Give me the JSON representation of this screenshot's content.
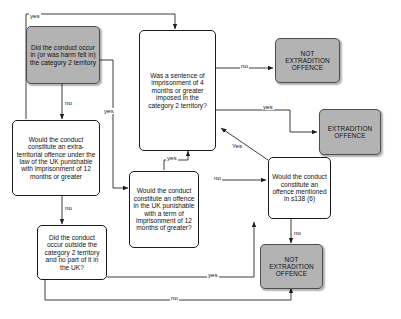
{
  "diagram": {
    "colors": {
      "shaded_fill": "#b3b3b3",
      "plain_fill": "#ffffff",
      "stroke": "#1a1a1a",
      "shaded_stroke": "#4d4d4d",
      "text": "#111111",
      "background": "#ffffff"
    },
    "nodes": [
      {
        "id": "conduct_in_cat2",
        "label": "Did the conduct occur in (or was harm felt in) the category 2 territory",
        "style": "shaded"
      },
      {
        "id": "sentence_4_months",
        "label": "Was a sentence of imprisonment of 4 months or greater imposed in the category 2 territory?",
        "style": "plain"
      },
      {
        "id": "not_extradition_top",
        "label": "NOT EXTRADITION OFFENCE",
        "style": "terminal"
      },
      {
        "id": "extra_territorial",
        "label": "Would the conduct constitute an extra-territorial offence under the law of the UK punishable with imprisonment of 12 months or greater",
        "style": "plain"
      },
      {
        "id": "extradition_offence",
        "label": "EXTRADITION OFFENCE",
        "style": "terminal"
      },
      {
        "id": "s138_6",
        "label": "Would the conduct constitute an offence mentioned in s138 (6)",
        "style": "plain"
      },
      {
        "id": "uk_offence_12_months",
        "label": "Would the conduct constitute an offence in the UK punishable with a term of imprisonment of 12 months of greater?",
        "style": "plain"
      },
      {
        "id": "conduct_outside_cat2",
        "label": "Did the conduct occur outside the category 2 territory and no part of it in the UK?",
        "style": "plain"
      },
      {
        "id": "not_extradition_bottom",
        "label": "NOT EXTRADITION OFFENCE",
        "style": "terminal"
      }
    ],
    "edge_labels": [
      {
        "id": "yes_top_left",
        "text": "yes"
      },
      {
        "id": "no_conduct_in_cat2",
        "text": "no"
      },
      {
        "id": "yes_conduct_in_cat2",
        "text": "yes"
      },
      {
        "id": "no_sentence",
        "text": "no"
      },
      {
        "id": "yes_sentence",
        "text": "yes"
      },
      {
        "id": "yes_s138_diagonal",
        "text": "Yes"
      },
      {
        "id": "no_extra_territorial",
        "text": "no"
      },
      {
        "id": "yes_uk_offence_up",
        "text": "yes"
      },
      {
        "id": "no_uk_offence_right",
        "text": "no"
      },
      {
        "id": "no_s138",
        "text": "no"
      },
      {
        "id": "yes_outside_cat2",
        "text": "yes"
      },
      {
        "id": "no_outside_cat2",
        "text": "no"
      }
    ]
  }
}
